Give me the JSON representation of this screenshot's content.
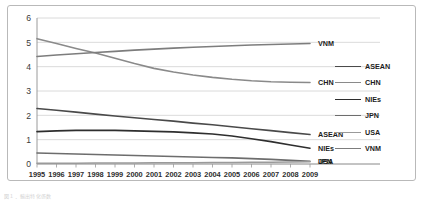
{
  "chart_data": {
    "type": "line",
    "title": "",
    "xlabel": "",
    "ylabel": "",
    "x": [
      1995,
      1996,
      1997,
      1998,
      1999,
      2000,
      2001,
      2002,
      2003,
      2004,
      2005,
      2006,
      2007,
      2008,
      2009
    ],
    "xlim": [
      1995,
      2009
    ],
    "ylim": [
      0,
      6
    ],
    "yticks": [
      0,
      1,
      2,
      3,
      4,
      5,
      6
    ],
    "grid": "horizontal",
    "legend_position": "right",
    "series": [
      {
        "name": "ASEAN",
        "color": "#4a4a4a",
        "end_label": "ASEAN",
        "values": [
          2.28,
          2.21,
          2.13,
          2.05,
          1.97,
          1.9,
          1.83,
          1.76,
          1.68,
          1.61,
          1.53,
          1.45,
          1.37,
          1.29,
          1.21
        ]
      },
      {
        "name": "CHN",
        "color": "#8a8a8a",
        "end_label": "CHN",
        "values": [
          5.15,
          4.95,
          4.75,
          4.56,
          4.35,
          4.13,
          3.93,
          3.78,
          3.66,
          3.56,
          3.48,
          3.42,
          3.38,
          3.36,
          3.35
        ]
      },
      {
        "name": "NIEs",
        "color": "#2e2e2e",
        "end_label": "NIEs",
        "values": [
          1.33,
          1.36,
          1.38,
          1.39,
          1.38,
          1.36,
          1.34,
          1.32,
          1.28,
          1.23,
          1.15,
          1.04,
          0.92,
          0.78,
          0.65
        ]
      },
      {
        "name": "JPN",
        "color": "#6d6d6d",
        "end_label": "JPN",
        "values": [
          0.45,
          0.43,
          0.41,
          0.39,
          0.37,
          0.35,
          0.33,
          0.31,
          0.29,
          0.27,
          0.25,
          0.22,
          0.19,
          0.15,
          0.11
        ]
      },
      {
        "name": "USA",
        "color": "#9a9a9a",
        "end_label": "USA",
        "values": [
          0.03,
          0.03,
          0.03,
          0.04,
          0.04,
          0.04,
          0.05,
          0.05,
          0.05,
          0.06,
          0.06,
          0.07,
          0.07,
          0.08,
          0.09
        ]
      },
      {
        "name": "VNM",
        "color": "#7d7d7d",
        "end_label": "VNM",
        "values": [
          4.42,
          4.48,
          4.53,
          4.58,
          4.63,
          4.68,
          4.72,
          4.76,
          4.8,
          4.83,
          4.86,
          4.89,
          4.91,
          4.93,
          4.95
        ]
      }
    ]
  },
  "legend": {
    "items": [
      {
        "label": "ASEAN",
        "color": "#4a4a4a"
      },
      {
        "label": "CHN",
        "color": "#8a8a8a"
      },
      {
        "label": "NIEs",
        "color": "#2e2e2e"
      },
      {
        "label": "JPN",
        "color": "#6d6d6d"
      },
      {
        "label": "USA",
        "color": "#9a9a9a"
      },
      {
        "label": "VNM",
        "color": "#7d7d7d"
      }
    ]
  },
  "caption": {
    "text": "図１．輸出特化係数"
  }
}
